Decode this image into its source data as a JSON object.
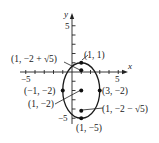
{
  "diagram": {
    "type": "ellipse-graph",
    "axes": {
      "x_label": "x",
      "y_label": "y",
      "x_tick_labels": [
        {
          "value": -5,
          "text": "−5"
        },
        {
          "value": 5,
          "text": "5"
        }
      ],
      "y_tick_labels": [
        {
          "value": 5,
          "text": "5"
        },
        {
          "value": -5,
          "text": "−5"
        }
      ],
      "x_range": [
        -6,
        6
      ],
      "y_range": [
        -6,
        6
      ]
    },
    "ellipse": {
      "center": [
        1,
        -2
      ],
      "semi_axis_x": 2,
      "semi_axis_y": 3,
      "color": "#1a1a1a"
    },
    "points": [
      {
        "id": "top-vertex",
        "x": 1,
        "y": 1,
        "label": "(1, 1)"
      },
      {
        "id": "upper-focus",
        "x": 1,
        "y": 0.236,
        "label": "(1, −2 + √5)"
      },
      {
        "id": "left-covertex",
        "x": -1,
        "y": -2,
        "label": "(−1, −2)"
      },
      {
        "id": "center",
        "x": 1,
        "y": -2,
        "label": "(1, −2)"
      },
      {
        "id": "right-covertex",
        "x": 3,
        "y": -2,
        "label": "(3, −2)"
      },
      {
        "id": "lower-focus",
        "x": 1,
        "y": -4.236,
        "label": "(1, −2 − √5)"
      },
      {
        "id": "bottom-vertex",
        "x": 1,
        "y": -5,
        "label": "(1, −5)"
      }
    ]
  }
}
